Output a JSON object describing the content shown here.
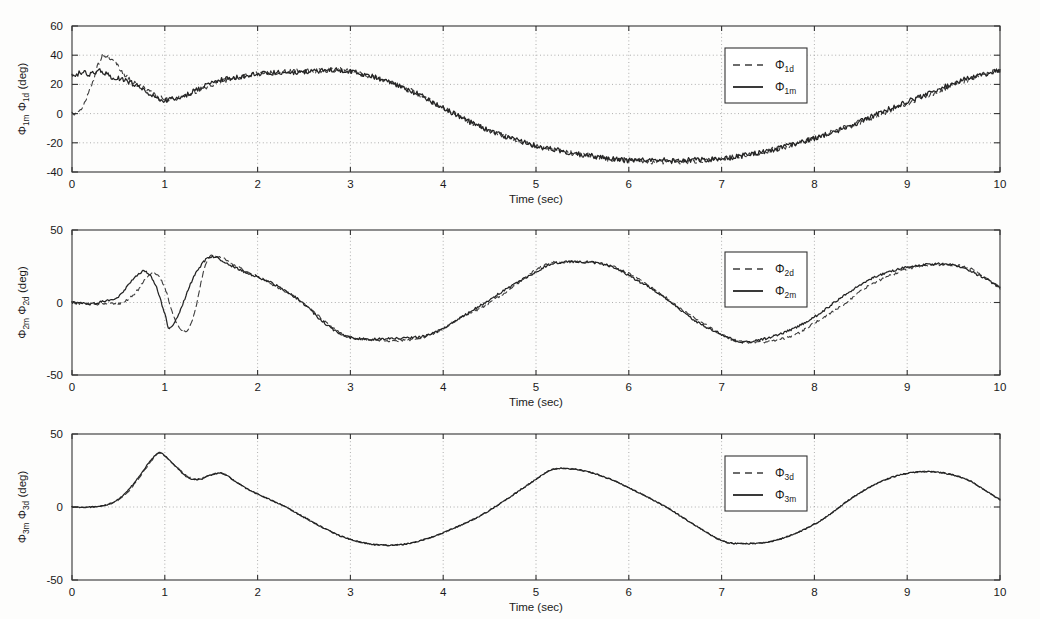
{
  "figure": {
    "background_color": "#fdfdfc",
    "line_color_measured": "#242424",
    "line_color_desired": "#3d3d3d",
    "grid_color": "#9a9a9a"
  },
  "subplots": [
    {
      "id": "subplot-1",
      "ylabel_main": "Φ",
      "ylabel_sub_a": "1m",
      "ylabel_mid": " Φ",
      "ylabel_sub_b": "1d",
      "ylabel_units": " (deg)",
      "xlabel": "Time (sec)",
      "xticks": [
        "0",
        "1",
        "2",
        "3",
        "4",
        "5",
        "6",
        "7",
        "8",
        "9",
        "10"
      ],
      "yticks": [
        "60",
        "40",
        "20",
        "0",
        "-20",
        "-40"
      ],
      "legend": [
        {
          "label_main": "Φ",
          "label_sub": "1d",
          "style": "dashed"
        },
        {
          "label_main": "Φ",
          "label_sub": "1m",
          "style": "solid"
        }
      ]
    },
    {
      "id": "subplot-2",
      "ylabel_main": "Φ",
      "ylabel_sub_a": "2m",
      "ylabel_mid": " Φ",
      "ylabel_sub_b": "2d",
      "ylabel_units": " (deg)",
      "xlabel": "Time (sec)",
      "xticks": [
        "0",
        "1",
        "2",
        "3",
        "4",
        "5",
        "6",
        "7",
        "8",
        "9",
        "10"
      ],
      "yticks": [
        "50",
        "0",
        "-50"
      ],
      "legend": [
        {
          "label_main": "Φ",
          "label_sub": "2d",
          "style": "dashed"
        },
        {
          "label_main": "Φ",
          "label_sub": "2m",
          "style": "solid"
        }
      ]
    },
    {
      "id": "subplot-3",
      "ylabel_main": "Φ",
      "ylabel_sub_a": "3m",
      "ylabel_mid": " Φ",
      "ylabel_sub_b": "3d",
      "ylabel_units": " (deg)",
      "xlabel": "Time (sec)",
      "xticks": [
        "0",
        "1",
        "2",
        "3",
        "4",
        "5",
        "6",
        "7",
        "8",
        "9",
        "10"
      ],
      "yticks": [
        "50",
        "0",
        "-50"
      ],
      "legend": [
        {
          "label_main": "Φ",
          "label_sub": "3d",
          "style": "dashed"
        },
        {
          "label_main": "Φ",
          "label_sub": "3m",
          "style": "solid"
        }
      ]
    }
  ],
  "chart_data": [
    {
      "type": "line",
      "title": "",
      "xlabel": "Time (sec)",
      "ylabel": "Φ_1m Φ_1d (deg)",
      "xlim": [
        0,
        10
      ],
      "ylim": [
        -40,
        60
      ],
      "xticks": [
        0,
        1,
        2,
        3,
        4,
        5,
        6,
        7,
        8,
        9,
        10
      ],
      "yticks": [
        -40,
        -20,
        0,
        20,
        40,
        60
      ],
      "grid": true,
      "legend_position": "upper-right",
      "noise_amplitude": 1.8,
      "series": [
        {
          "name": "Φ_1d",
          "style": "dashed",
          "x": [
            0,
            0.1,
            0.2,
            0.3,
            0.35,
            0.45,
            0.55,
            0.7,
            0.85,
            1.0,
            1.2,
            1.4,
            1.6,
            1.8,
            2.0,
            2.2,
            2.4,
            2.6,
            2.8,
            3.0,
            3.2,
            3.4,
            3.6,
            3.8,
            4.0,
            4.3,
            4.6,
            5.0,
            5.4,
            5.8,
            6.0,
            6.3,
            6.6,
            7.0,
            7.3,
            7.6,
            8.0,
            8.4,
            8.8,
            9.2,
            9.6,
            10.0
          ],
          "y": [
            0,
            3,
            18,
            36,
            40,
            36,
            27,
            20,
            14,
            10,
            12,
            17,
            22,
            25,
            27,
            28,
            29,
            29,
            30,
            29,
            26,
            22,
            17,
            11,
            4,
            -6,
            -14,
            -22,
            -27,
            -31,
            -32,
            -33,
            -33,
            -31,
            -28,
            -24,
            -17,
            -8,
            2,
            12,
            22,
            30
          ]
        },
        {
          "name": "Φ_1m",
          "style": "solid",
          "x": [
            0,
            0.1,
            0.2,
            0.3,
            0.4,
            0.5,
            0.6,
            0.7,
            0.85,
            1.0,
            1.2,
            1.4,
            1.6,
            1.8,
            2.0,
            2.2,
            2.4,
            2.6,
            2.8,
            3.0,
            3.2,
            3.4,
            3.6,
            3.8,
            4.0,
            4.3,
            4.6,
            5.0,
            5.4,
            5.8,
            6.0,
            6.3,
            6.6,
            7.0,
            7.3,
            7.6,
            8.0,
            8.4,
            8.8,
            9.2,
            9.6,
            10.0
          ],
          "y": [
            26,
            28,
            27,
            29,
            26,
            24,
            22,
            19,
            13,
            9,
            12,
            18,
            23,
            25,
            27,
            28,
            28,
            29,
            30,
            29,
            26,
            22,
            17,
            11,
            4,
            -6,
            -14,
            -22,
            -27,
            -31,
            -32,
            -32,
            -32,
            -31,
            -28,
            -24,
            -17,
            -8,
            3,
            13,
            23,
            30
          ]
        }
      ]
    },
    {
      "type": "line",
      "title": "",
      "xlabel": "Time (sec)",
      "ylabel": "Φ_2m Φ_2d (deg)",
      "xlim": [
        0,
        10
      ],
      "ylim": [
        -50,
        50
      ],
      "xticks": [
        0,
        1,
        2,
        3,
        4,
        5,
        6,
        7,
        8,
        9,
        10
      ],
      "yticks": [
        -50,
        0,
        50
      ],
      "grid": true,
      "legend_position": "upper-right",
      "noise_amplitude": 0.8,
      "series": [
        {
          "name": "Φ_2d",
          "style": "dashed",
          "x": [
            0,
            0.2,
            0.4,
            0.55,
            0.7,
            0.8,
            0.9,
            1.0,
            1.1,
            1.2,
            1.3,
            1.45,
            1.6,
            1.8,
            2.0,
            2.2,
            2.4,
            2.6,
            2.8,
            3.0,
            3.3,
            3.6,
            3.8,
            4.0,
            4.2,
            4.4,
            4.6,
            4.8,
            5.1,
            5.4,
            5.7,
            6.0,
            6.3,
            6.6,
            7.0,
            7.2,
            7.5,
            7.8,
            8.0,
            8.3,
            8.6,
            9.0,
            9.3,
            9.6,
            9.8,
            10.0
          ],
          "y": [
            0,
            -1,
            -1,
            0,
            8,
            17,
            20,
            10,
            -10,
            -20,
            -12,
            28,
            31,
            24,
            18,
            11,
            4,
            -6,
            -17,
            -24,
            -26,
            -26,
            -24,
            -18,
            -10,
            -4,
            4,
            13,
            26,
            28,
            27,
            20,
            8,
            -6,
            -22,
            -27,
            -27,
            -22,
            -14,
            -2,
            12,
            23,
            26,
            25,
            19,
            10
          ]
        },
        {
          "name": "Φ_2m",
          "style": "solid",
          "x": [
            0,
            0.2,
            0.35,
            0.5,
            0.62,
            0.72,
            0.8,
            0.9,
            1.0,
            1.05,
            1.15,
            1.3,
            1.45,
            1.55,
            1.7,
            1.9,
            2.1,
            2.3,
            2.5,
            2.7,
            2.9,
            3.1,
            3.4,
            3.7,
            3.9,
            4.1,
            4.3,
            4.5,
            4.7,
            5.0,
            5.2,
            5.5,
            5.8,
            6.1,
            6.4,
            6.7,
            7.0,
            7.2,
            7.4,
            7.7,
            8.0,
            8.3,
            8.6,
            8.9,
            9.2,
            9.5,
            9.8,
            10.0
          ],
          "y": [
            0,
            -1,
            1,
            4,
            13,
            20,
            21,
            12,
            -8,
            -18,
            -8,
            16,
            30,
            31,
            26,
            20,
            15,
            8,
            -1,
            -13,
            -22,
            -25,
            -25,
            -24,
            -21,
            -14,
            -6,
            2,
            10,
            21,
            27,
            28,
            25,
            15,
            3,
            -12,
            -22,
            -27,
            -26,
            -20,
            -10,
            4,
            16,
            23,
            26,
            26,
            18,
            10
          ]
        }
      ]
    },
    {
      "type": "line",
      "title": "",
      "xlabel": "Time (sec)",
      "ylabel": "Φ_3m Φ_3d (deg)",
      "xlim": [
        0,
        10
      ],
      "ylim": [
        -50,
        50
      ],
      "xticks": [
        0,
        1,
        2,
        3,
        4,
        5,
        6,
        7,
        8,
        9,
        10
      ],
      "yticks": [
        -50,
        0,
        50
      ],
      "grid": true,
      "legend_position": "upper-right",
      "noise_amplitude": 0.4,
      "series": [
        {
          "name": "Φ_3d",
          "style": "dashed",
          "x": [
            0,
            0.2,
            0.4,
            0.55,
            0.7,
            0.85,
            0.95,
            1.1,
            1.25,
            1.35,
            1.5,
            1.62,
            1.75,
            1.9,
            2.1,
            2.3,
            2.5,
            2.7,
            2.9,
            3.1,
            3.3,
            3.5,
            3.7,
            3.9,
            4.1,
            4.4,
            4.7,
            5.0,
            5.2,
            5.5,
            5.8,
            6.1,
            6.4,
            6.7,
            7.0,
            7.2,
            7.5,
            7.8,
            8.1,
            8.4,
            8.7,
            9.0,
            9.3,
            9.6,
            9.8,
            10.0
          ],
          "y": [
            0,
            0,
            2,
            7,
            18,
            31,
            37,
            29,
            21,
            19,
            22,
            23,
            18,
            12,
            6,
            0,
            -7,
            -14,
            -20,
            -24,
            -26,
            -26,
            -24,
            -20,
            -15,
            -6,
            6,
            19,
            26,
            25,
            19,
            10,
            0,
            -12,
            -23,
            -25,
            -24,
            -18,
            -8,
            6,
            17,
            23,
            24,
            20,
            13,
            5
          ]
        },
        {
          "name": "Φ_3m",
          "style": "solid",
          "x": [
            0,
            0.2,
            0.4,
            0.55,
            0.7,
            0.85,
            0.95,
            1.1,
            1.25,
            1.38,
            1.5,
            1.62,
            1.75,
            1.9,
            2.1,
            2.3,
            2.5,
            2.7,
            2.9,
            3.1,
            3.3,
            3.5,
            3.7,
            3.9,
            4.1,
            4.4,
            4.7,
            5.0,
            5.2,
            5.5,
            5.8,
            6.1,
            6.4,
            6.7,
            7.0,
            7.2,
            7.5,
            7.8,
            8.1,
            8.4,
            8.7,
            9.0,
            9.3,
            9.6,
            9.8,
            10.0
          ],
          "y": [
            0,
            0,
            2,
            8,
            19,
            32,
            37,
            29,
            20,
            19,
            22,
            23,
            18,
            12,
            6,
            0,
            -7,
            -14,
            -20,
            -24,
            -26,
            -26,
            -24,
            -20,
            -15,
            -6,
            6,
            19,
            26,
            25,
            19,
            10,
            0,
            -12,
            -23,
            -25,
            -24,
            -18,
            -8,
            6,
            17,
            23,
            24,
            20,
            13,
            5
          ]
        }
      ]
    }
  ]
}
